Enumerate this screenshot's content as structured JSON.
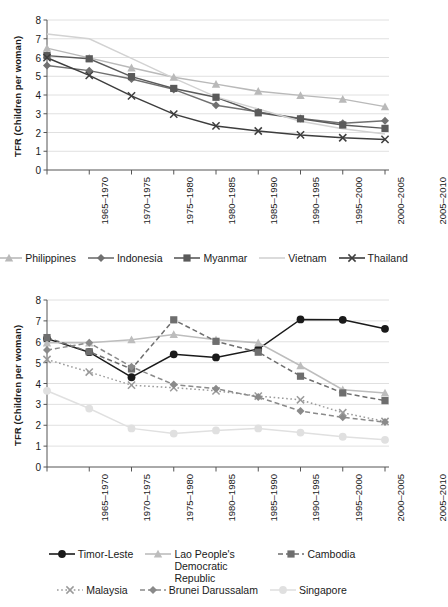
{
  "chart_data": [
    {
      "id": "chart-upper",
      "type": "line",
      "title": "",
      "xlabel": "",
      "ylabel": "TFR (Children per woman)",
      "ylim": [
        0,
        8
      ],
      "yticks": [
        0,
        1,
        2,
        3,
        4,
        5,
        6,
        7,
        8
      ],
      "grid": true,
      "legend_position": "bottom",
      "categories": [
        "1965–1970",
        "1970–1975",
        "1975–1980",
        "1980–1985",
        "1985–1990",
        "1990–1995",
        "1995–2000",
        "2000–2005",
        "2005–2010"
      ],
      "series": [
        {
          "name": "Philippines",
          "marker": "triangle",
          "color": "#b9b9b9",
          "dash": "none",
          "values": [
            6.5,
            5.98,
            5.45,
            4.95,
            4.58,
            4.2,
            3.98,
            3.78,
            3.38
          ]
        },
        {
          "name": "Indonesia",
          "marker": "diamond",
          "color": "#707070",
          "dash": "none",
          "values": [
            5.57,
            5.3,
            4.85,
            4.3,
            3.45,
            3.1,
            2.75,
            2.5,
            2.63
          ]
        },
        {
          "name": "Myanmar",
          "marker": "square",
          "color": "#5a5a5a",
          "dash": "none",
          "values": [
            6.1,
            5.93,
            4.98,
            4.35,
            3.88,
            3.05,
            2.73,
            2.4,
            2.22
          ]
        },
        {
          "name": "Vietnam",
          "marker": "none",
          "color": "#d2d2d2",
          "dash": "none",
          "values": [
            7.25,
            7.0,
            5.95,
            4.9,
            3.9,
            3.25,
            2.6,
            2.2,
            1.92
          ]
        },
        {
          "name": "Thailand",
          "marker": "cross",
          "color": "#3d3d3d",
          "dash": "none",
          "values": [
            5.99,
            5.05,
            3.95,
            2.98,
            2.35,
            2.08,
            1.87,
            1.72,
            1.63
          ]
        }
      ]
    },
    {
      "id": "chart-lower",
      "type": "line",
      "title": "",
      "xlabel": "",
      "ylabel": "TFR (Children per woman)",
      "ylim": [
        0,
        8
      ],
      "yticks": [
        0,
        1,
        2,
        3,
        4,
        5,
        6,
        7,
        8
      ],
      "grid": true,
      "legend_position": "bottom",
      "categories": [
        "1965–1970",
        "1970–1975",
        "1975–1980",
        "1980–1985",
        "1985–1990",
        "1990–1995",
        "1995–2000",
        "2000–2005",
        "2005–2010"
      ],
      "series": [
        {
          "name": "Timor-Leste",
          "marker": "circle",
          "color": "#1a1a1a",
          "dash": "none",
          "values": [
            6.15,
            5.5,
            4.3,
            5.4,
            5.25,
            5.65,
            7.07,
            7.05,
            6.62
          ]
        },
        {
          "name": "Lao People's Democratic Republic",
          "marker": "triangle",
          "color": "#bdbdbd",
          "dash": "none",
          "values": [
            5.95,
            5.95,
            6.1,
            6.35,
            6.1,
            5.95,
            4.85,
            3.7,
            3.55
          ]
        },
        {
          "name": "Cambodia",
          "marker": "square",
          "color": "#6e6e6e",
          "dash": "dashed",
          "values": [
            6.2,
            5.52,
            4.7,
            7.05,
            6.02,
            5.5,
            4.35,
            3.55,
            3.18
          ]
        },
        {
          "name": "Malaysia",
          "marker": "cross",
          "color": "#9a9a9a",
          "dash": "dotted",
          "values": [
            5.15,
            4.55,
            3.92,
            3.8,
            3.65,
            3.4,
            3.22,
            2.6,
            2.18
          ]
        },
        {
          "name": "Brunei Darussalam",
          "marker": "diamond",
          "color": "#8a8a8a",
          "dash": "dashed",
          "values": [
            5.6,
            5.95,
            4.8,
            3.95,
            3.75,
            3.35,
            2.68,
            2.38,
            2.15
          ]
        },
        {
          "name": "Singapore",
          "marker": "circle",
          "color": "#e0e0e0",
          "dash": "none",
          "values": [
            3.65,
            2.8,
            1.85,
            1.6,
            1.75,
            1.85,
            1.65,
            1.45,
            1.3
          ]
        }
      ]
    }
  ]
}
